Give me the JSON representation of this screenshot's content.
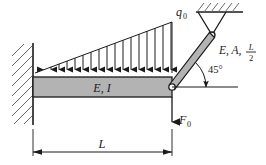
{
  "figure": {
    "background_color": "#ffffff",
    "line_color": "#1a1a1a",
    "member_fill": "#b3b3b3",
    "hatch_color": "#555555",
    "width": 266,
    "height": 165
  },
  "labels": {
    "distributed_load": "q",
    "distributed_load_sub": "0",
    "beam": "E, I",
    "bar_prefix": "E, A,",
    "bar_fraction_num": "L",
    "bar_fraction_den": "2",
    "angle": "45°",
    "point_load": "F",
    "point_load_sub": "0",
    "dimension": "L"
  },
  "geometry": {
    "beam": {
      "x": 33,
      "y": 77,
      "width": 139,
      "height": 20
    },
    "wall": {
      "x": 12,
      "y": 43,
      "width": 21,
      "height": 82,
      "hatch_count": 9
    },
    "load": {
      "apex_left_x": 35,
      "apex_right_x": 172,
      "baseline_y": 73,
      "peak_top_y": 22,
      "arrow_count": 18
    },
    "bar": {
      "start_x": 172,
      "start_y": 87,
      "end_x": 212,
      "end_y": 35,
      "thickness": 5,
      "angle_deg": 45
    },
    "pin_top": {
      "cx": 212,
      "cy": 35,
      "r": 3
    },
    "pin_beam": {
      "cx": 172,
      "cy": 87,
      "r": 3
    },
    "ceiling": {
      "x1": 196,
      "x2": 243,
      "y": 12,
      "hatch_count": 6
    },
    "support_triangle": {
      "apex_x": 212,
      "apex_y": 35,
      "left_x": 198,
      "right_x": 226,
      "top_y": 12
    },
    "angle_reference_line": {
      "x1": 172,
      "x2": 238,
      "y": 87
    },
    "point_load_arrow": {
      "x": 172,
      "y1": 97,
      "y2": 124
    },
    "dimension_line": {
      "x1": 33,
      "x2": 172,
      "y": 152
    }
  }
}
